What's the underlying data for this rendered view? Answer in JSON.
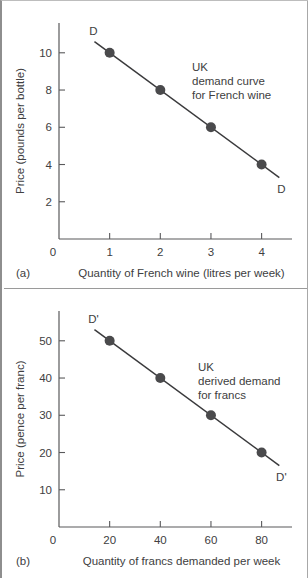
{
  "figure": {
    "panel_letter_a": "(a)",
    "panel_letter_b": "(b)",
    "caption_partial": ""
  },
  "chart_data": [
    {
      "id": "panel-a",
      "type": "line",
      "panel_label": "(a)",
      "title": "",
      "xlabel": "Quantity of French wine (litres per week)",
      "ylabel": "Price (pounds per bottle)",
      "x": [
        1,
        2,
        3,
        4
      ],
      "values": [
        10,
        8,
        6,
        4
      ],
      "series": [
        {
          "name": "D",
          "values": [
            10,
            8,
            6,
            4
          ]
        }
      ],
      "xlim": [
        0,
        4.6
      ],
      "ylim": [
        0,
        11.6
      ],
      "xticks": [
        0,
        1,
        2,
        3,
        4
      ],
      "xtick_labels": [
        "0",
        "1",
        "2",
        "3",
        "4"
      ],
      "yticks": [
        2,
        4,
        6,
        8,
        10
      ],
      "ytick_labels": [
        "2",
        "4",
        "6",
        "8",
        "10"
      ],
      "y_origin_label": "0",
      "grid": false,
      "legend": "none",
      "curve_label_start": "D",
      "curve_label_end": "D",
      "annotation_lines": [
        "UK",
        "demand curve",
        "for French wine"
      ],
      "line_extent_x": [
        0.7,
        4.35
      ],
      "markers": "filled-circle",
      "marker_color": "#4a4a4c",
      "line_color": "#3a3a3c"
    },
    {
      "id": "panel-b",
      "type": "line",
      "panel_label": "(b)",
      "title": "",
      "xlabel": "Quantity of francs demanded per week",
      "ylabel": "Price (pence per franc)",
      "x": [
        20,
        40,
        60,
        80
      ],
      "values": [
        50,
        40,
        30,
        20
      ],
      "series": [
        {
          "name": "D'",
          "values": [
            50,
            40,
            30,
            20
          ]
        }
      ],
      "xlim": [
        0,
        92
      ],
      "ylim": [
        0,
        58
      ],
      "xticks": [
        0,
        20,
        40,
        60,
        80
      ],
      "xtick_labels": [
        "0",
        "20",
        "40",
        "60",
        "80"
      ],
      "yticks": [
        10,
        20,
        30,
        40,
        50
      ],
      "ytick_labels": [
        "10",
        "20",
        "30",
        "40",
        "50"
      ],
      "y_origin_label": "0",
      "grid": false,
      "legend": "none",
      "curve_label_start": "D'",
      "curve_label_end": "D'",
      "annotation_lines": [
        "UK",
        "derived demand",
        "for francs"
      ],
      "line_extent_x": [
        14,
        87
      ],
      "markers": "filled-circle",
      "marker_color": "#4a4a4c",
      "line_color": "#3a3a3c"
    }
  ]
}
